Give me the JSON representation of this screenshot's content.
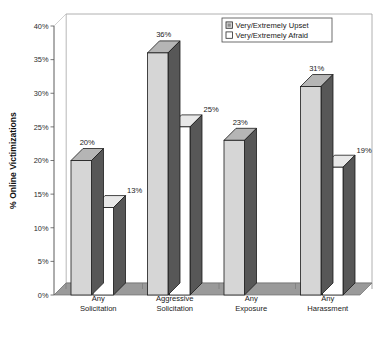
{
  "chart_data": {
    "type": "bar",
    "title": "",
    "subtitle": "",
    "xlabel": "",
    "ylabel": "% Online Victimizations",
    "ylim": [
      0,
      40
    ],
    "ytick_labels": [
      "0%",
      "5%",
      "10%",
      "15%",
      "20%",
      "25%",
      "30%",
      "35%",
      "40%"
    ],
    "ytick_values": [
      0,
      5,
      10,
      15,
      20,
      25,
      30,
      35,
      40
    ],
    "grid": false,
    "legend_position": "top-right",
    "style": "3d-grouped-bar",
    "categories": [
      "Any Solicitation",
      "Aggressive Solicitation",
      "Any Exposure",
      "Any Harassment"
    ],
    "category_lines": [
      [
        "Any",
        "Solicitation"
      ],
      [
        "Aggressive",
        "Solicitation"
      ],
      [
        "Any",
        "Exposure"
      ],
      [
        "Any",
        "Harassment"
      ]
    ],
    "series": [
      {
        "name": "Very/Extremely Upset",
        "color": "#d6d6d6",
        "values": [
          20,
          36,
          23,
          31
        ],
        "data_labels": [
          "20%",
          "36%",
          "23%",
          "31%"
        ]
      },
      {
        "name": "Very/Extremely Afraid",
        "color": "#ffffff",
        "values": [
          13,
          25,
          null,
          19
        ],
        "data_labels": [
          "13%",
          "25%",
          "",
          "19%"
        ]
      }
    ]
  },
  "legend": {
    "items": [
      {
        "label": "Very/Extremely Upset",
        "swatch": "#d6d6d6"
      },
      {
        "label": "Very/Extremely Afraid",
        "swatch": "#ffffff"
      }
    ]
  },
  "axes": {
    "y_title": "% Online Victimizations"
  },
  "colors": {
    "bar_front_gray": "#d6d6d6",
    "bar_front_white": "#ffffff",
    "bar_side_dark": "#575757",
    "bar_top_gray": "#b5b5b5",
    "bar_top_white": "#e8e8e8",
    "floor": "#9a9a9a",
    "wall": "#ffffff",
    "outline": "#1a1a1a",
    "axis": "#555555"
  }
}
